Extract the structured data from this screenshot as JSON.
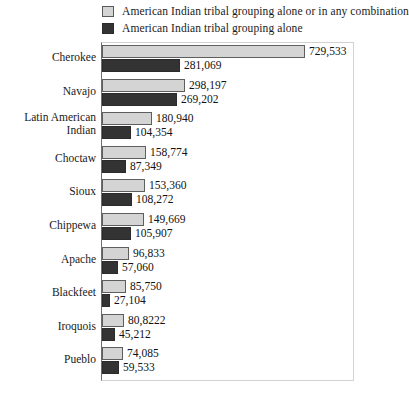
{
  "legend": {
    "items": [
      {
        "label": "American Indian tribal grouping alone or in any combination",
        "swatch": "light",
        "color": "#d4d4d4"
      },
      {
        "label": "American Indian tribal grouping alone",
        "swatch": "dark",
        "color": "#333333"
      }
    ]
  },
  "chart_data": {
    "type": "bar",
    "orientation": "horizontal",
    "title": "",
    "subtitle": "",
    "xlabel": "",
    "ylabel": "",
    "grid": false,
    "legend_position": "top",
    "xlim": [
      0,
      729533
    ],
    "categories": [
      "Cherokee",
      "Navajo",
      "Latin American\nIndian",
      "Choctaw",
      "Sioux",
      "Chippewa",
      "Apache",
      "Blackfeet",
      "Iroquois",
      "Pueblo"
    ],
    "series": [
      {
        "name": "American Indian tribal grouping alone or in any combination",
        "color": "#d4d4d4",
        "values": [
          729533,
          298197,
          180940,
          158774,
          153360,
          149669,
          96833,
          85750,
          80822,
          74085
        ],
        "labels": [
          "729,533",
          "298,197",
          "180,940",
          "158,774",
          "153,360",
          "149,669",
          "96,833",
          "85,750",
          "80,8222",
          "74,085"
        ]
      },
      {
        "name": "American Indian tribal grouping alone",
        "color": "#333333",
        "values": [
          281069,
          269202,
          104354,
          87349,
          108272,
          105907,
          57060,
          27104,
          45212,
          59533
        ],
        "labels": [
          "281,069",
          "269,202",
          "104,354",
          "87,349",
          "108,272",
          "105,907",
          "57,060",
          "27,104",
          "45,212",
          "59,533"
        ]
      }
    ]
  }
}
